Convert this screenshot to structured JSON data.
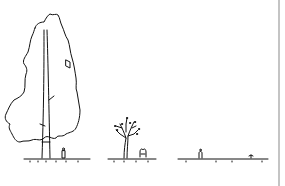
{
  "illustration": {
    "subject": "tree growth stages line drawing",
    "scenes": [
      {
        "name": "mature-tree",
        "elements": [
          "tall tree",
          "person figure",
          "ground line"
        ]
      },
      {
        "name": "young-tree",
        "elements": [
          "small branching tree",
          "person figure",
          "ground line"
        ]
      },
      {
        "name": "seedling",
        "elements": [
          "person figure",
          "sprout",
          "ground line"
        ]
      }
    ],
    "colors": {
      "ink": "#111111",
      "background": "#ffffff",
      "divider": "#c4c4c4"
    }
  }
}
